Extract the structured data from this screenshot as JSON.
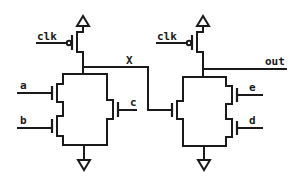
{
  "diagram": {
    "type": "cmos-dynamic-logic-schematic",
    "line_color": "#1a1a1a",
    "background": "#ffffff",
    "stages": [
      {
        "id": "stage1",
        "precharge": {
          "type": "pmos",
          "gate_label": "clk"
        },
        "pulldown": {
          "topology": "(a series b) parallel c",
          "inputs": [
            {
              "label": "a"
            },
            {
              "label": "b"
            },
            {
              "label": "c"
            }
          ]
        },
        "output_node_label": "X"
      },
      {
        "id": "stage2",
        "precharge": {
          "type": "pmos",
          "gate_label": "clk"
        },
        "pulldown": {
          "topology": "X parallel (e series d)",
          "inputs": [
            {
              "label": "X"
            },
            {
              "label": "e"
            },
            {
              "label": "d"
            }
          ]
        },
        "output_node_label": "out"
      }
    ],
    "supplies": {
      "vdd_symbol": "open-triangle-up",
      "gnd_symbol": "open-triangle-down"
    }
  }
}
